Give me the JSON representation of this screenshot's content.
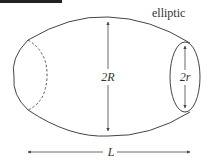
{
  "diagram": {
    "title": "elliptic",
    "labels": {
      "big_diameter": "2R",
      "small_diameter": "2r",
      "length": "L"
    },
    "colors": {
      "stroke": "#444444",
      "text": "#333333",
      "topbar": "#222222"
    }
  }
}
